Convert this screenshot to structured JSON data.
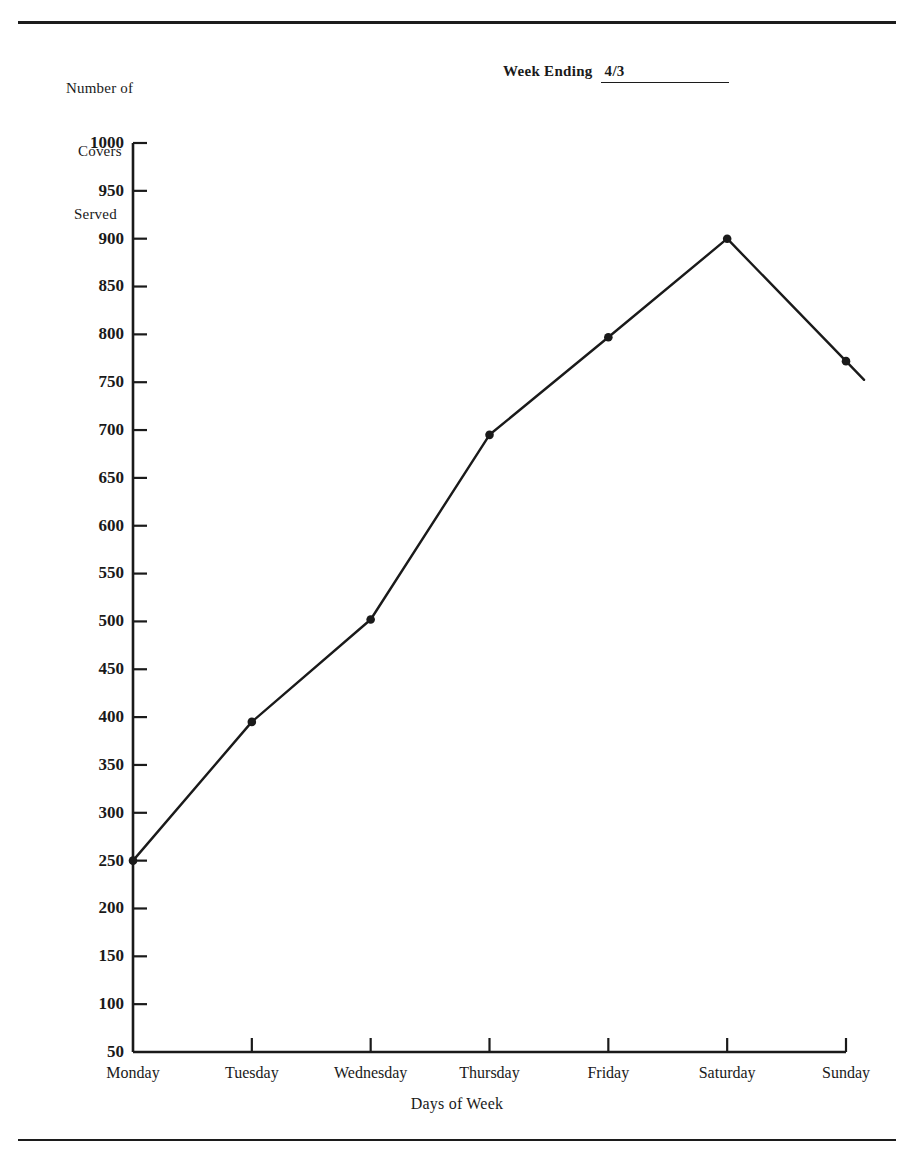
{
  "form": {
    "y_axis_title_lines": [
      "Number of",
      "Covers",
      "Served"
    ],
    "week_ending_label": "Week Ending",
    "week_ending_value": "4/3"
  },
  "chart_data": {
    "type": "line",
    "title": "",
    "subtitle": "",
    "xlabel": "Days of Week",
    "ylabel": "Number of Covers Served",
    "categories": [
      "Monday",
      "Tuesday",
      "Wednesday",
      "Thursday",
      "Friday",
      "Saturday",
      "Sunday"
    ],
    "values": [
      250,
      395,
      502,
      695,
      797,
      900,
      772
    ],
    "series": [
      {
        "name": "Covers Served",
        "values": [
          250,
          395,
          502,
          695,
          797,
          900,
          772
        ]
      }
    ],
    "ylim": [
      50,
      1000
    ],
    "ytick_step": 50,
    "yticks": [
      1000,
      950,
      900,
      850,
      800,
      750,
      700,
      650,
      600,
      550,
      500,
      450,
      400,
      350,
      300,
      250,
      200,
      150,
      100,
      50
    ],
    "ytick_labels": [
      "1000",
      "950",
      "900",
      "850",
      "800",
      "750",
      "700",
      "650",
      "600",
      "550",
      "500",
      "450",
      "400",
      "350",
      "300",
      "250",
      "200",
      "150",
      "100",
      "50"
    ],
    "grid": false,
    "legend": false,
    "legend_position": "none",
    "marker": "filled-circle",
    "line_color": "#1a1a1a",
    "marker_color": "#1a1a1a"
  }
}
